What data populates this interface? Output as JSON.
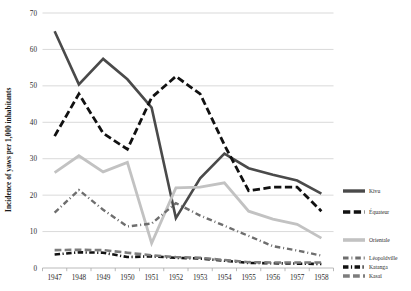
{
  "chart_data": {
    "type": "line",
    "title": "",
    "xlabel": "",
    "ylabel": "Incidence of yaws per 1,000 inhabitants",
    "categories": [
      "1947",
      "1948",
      "1949",
      "1950",
      "1951",
      "1952",
      "1953",
      "1954",
      "1955",
      "1956",
      "1957",
      "1958"
    ],
    "x": [
      1947,
      1948,
      1949,
      1950,
      1951,
      1952,
      1953,
      1954,
      1955,
      1956,
      1957,
      1958
    ],
    "ylim": [
      0,
      70
    ],
    "yticks": [
      0,
      10,
      20,
      30,
      40,
      50,
      60,
      70
    ],
    "ytick_labels": [
      "0",
      "10",
      "20",
      "30",
      "40",
      "50",
      "60",
      "70"
    ],
    "grid": true,
    "legend_position": "right",
    "series": [
      {
        "name": "Kivu",
        "color": "#4a4a4a",
        "style": "solid",
        "width": 2.6,
        "values": [
          65.0,
          50.4,
          57.4,
          51.8,
          44.0,
          13.7,
          24.6,
          31.4,
          27.4,
          25.6,
          24.0,
          20.4
        ]
      },
      {
        "name": "Équateur",
        "color": "#111111",
        "style": "dashed",
        "width": 2.8,
        "values": [
          36.2,
          47.8,
          37.0,
          32.6,
          46.8,
          52.6,
          47.8,
          33.8,
          21.2,
          22.2,
          22.2,
          15.6
        ]
      },
      {
        "name": "Orientale",
        "color": "#c2c2c2",
        "style": "solid",
        "width": 2.8,
        "values": [
          26.2,
          30.8,
          26.4,
          29.0,
          6.8,
          22.0,
          22.2,
          23.4,
          15.6,
          13.4,
          12.0,
          8.2
        ]
      },
      {
        "name": "Léopoldville",
        "color": "#6e6e6e",
        "style": "dashdot",
        "width": 2.4,
        "values": [
          15.2,
          21.4,
          16.0,
          11.4,
          12.2,
          17.8,
          14.4,
          11.6,
          8.8,
          6.0,
          4.8,
          3.4
        ]
      },
      {
        "name": "Katanga",
        "color": "#111111",
        "style": "dashdot-thick",
        "width": 2.6,
        "values": [
          3.7,
          4.3,
          4.2,
          3.0,
          3.2,
          2.8,
          2.6,
          2.0,
          1.4,
          1.3,
          1.2,
          1.1
        ]
      },
      {
        "name": "Kasaï",
        "color": "#7d7d7d",
        "style": "dashed",
        "width": 2.6,
        "values": [
          4.9,
          5.0,
          4.9,
          4.2,
          3.5,
          3.0,
          2.8,
          2.2,
          1.6,
          1.5,
          1.5,
          1.5
        ]
      }
    ]
  },
  "legend": {
    "entries": [
      {
        "label": "Kivu"
      },
      {
        "label": "Équateur"
      },
      {
        "label": "Orientale"
      },
      {
        "label": "Léopoldville"
      },
      {
        "label": "Katanga"
      },
      {
        "label": "Kasaï"
      }
    ]
  },
  "caption": {
    "text": ""
  }
}
